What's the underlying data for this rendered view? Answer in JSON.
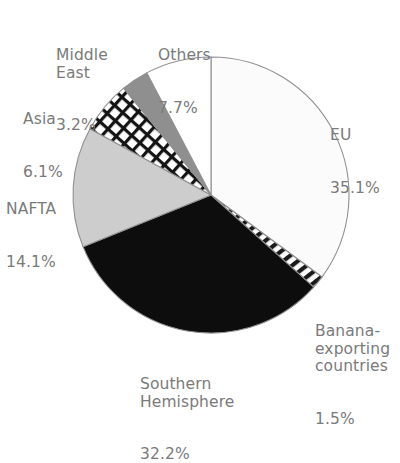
{
  "chart_data": {
    "type": "pie",
    "title": "",
    "categories": [
      "EU",
      "Banana-exporting countries",
      "Southern Hemisphere",
      "NAFTA",
      "Asia",
      "Middle East",
      "Others"
    ],
    "values": [
      35.1,
      1.5,
      32.2,
      14.1,
      6.1,
      3.2,
      7.7
    ],
    "unit": "%",
    "start_angle_deg": 0,
    "direction": "clockwise",
    "legend": "none",
    "grid": false,
    "slices": [
      {
        "label": "EU",
        "percent": "35.1%",
        "value": 35.1,
        "fill": "#fbfbfb",
        "pattern": "solid"
      },
      {
        "label": "Banana-exporting countries",
        "percent": "1.5%",
        "value": 1.5,
        "fill": "#ffffff",
        "pattern": "diagonal-hatch"
      },
      {
        "label": "Southern Hemisphere",
        "percent": "32.2%",
        "value": 32.2,
        "fill": "#0d0d0d",
        "pattern": "solid"
      },
      {
        "label": "NAFTA",
        "percent": "14.1%",
        "value": 14.1,
        "fill": "#cdcdcd",
        "pattern": "solid"
      },
      {
        "label": "Asia",
        "percent": "6.1%",
        "value": 6.1,
        "fill": "#ffffff",
        "pattern": "checker-grid"
      },
      {
        "label": "Middle East",
        "percent": "3.2%",
        "value": 3.2,
        "fill": "#8f8f8f",
        "pattern": "solid"
      },
      {
        "label": "Others",
        "percent": "7.7%",
        "value": 7.7,
        "fill": "#ffffff",
        "pattern": "solid"
      }
    ],
    "colors": {
      "outline": "#909090",
      "label_text": "#7a7a7a",
      "background": "#ffffff"
    }
  },
  "labels": {
    "middle_east": {
      "name": "Middle\nEast",
      "percent": "3.2%"
    },
    "others": {
      "name": "Others",
      "percent": "7.7%"
    },
    "eu": {
      "name": "EU",
      "percent": "35.1%"
    },
    "asia": {
      "name": "Asia",
      "percent": "6.1%"
    },
    "nafta": {
      "name": "NAFTA",
      "percent": "14.1%"
    },
    "banana": {
      "name": "Banana-\nexporting\ncountries",
      "percent": "1.5%"
    },
    "southern": {
      "name": "Southern\nHemisphere",
      "percent": "32.2%"
    }
  }
}
